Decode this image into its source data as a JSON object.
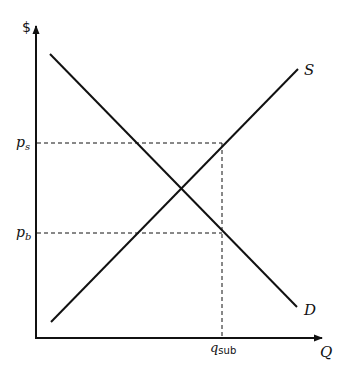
{
  "diagram": {
    "type": "supply-demand-subsidy",
    "axes": {
      "y_label": "$",
      "x_label": "Q"
    },
    "curves": [
      {
        "name": "supply",
        "label": "S"
      },
      {
        "name": "demand",
        "label": "D"
      }
    ],
    "price_levels": [
      {
        "name": "price-sellers",
        "label_base": "p",
        "label_sub": "s"
      },
      {
        "name": "price-buyers",
        "label_base": "p",
        "label_sub": "b"
      }
    ],
    "quantity_levels": [
      {
        "name": "quantity-subsidy",
        "label_base": "q",
        "label_sub": "sub"
      }
    ],
    "colors": {
      "line": "#111111",
      "background": "#ffffff"
    }
  }
}
